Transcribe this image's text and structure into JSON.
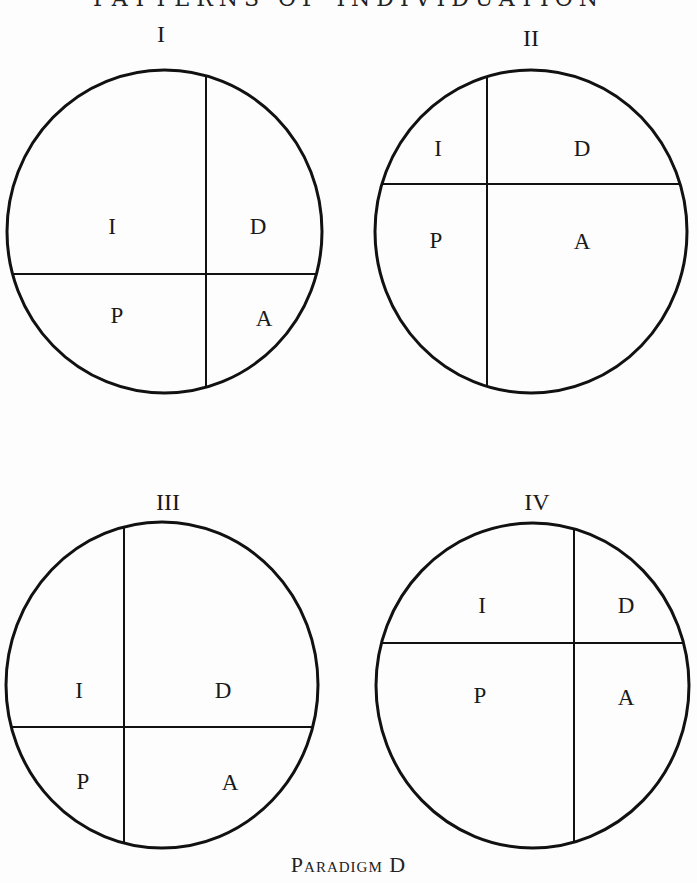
{
  "page": {
    "running_head": "PATTERNS OF INDIVIDUATION",
    "caption": "Paradigm D"
  },
  "style": {
    "ink": "#111111",
    "paper": "#fdfdfd",
    "circle_stroke_width": 3,
    "divider_stroke_width": 2
  },
  "diagrams": [
    {
      "id": "I",
      "title": "I",
      "title_pos": [
        161,
        42
      ],
      "circle": {
        "cx": 164.5,
        "cy": 231.5,
        "rx": 157.5,
        "ry": 161.5
      },
      "vertical_x": 206,
      "horizontal_y": 274,
      "cells": [
        {
          "label": "I",
          "x": 112,
          "y": 234
        },
        {
          "label": "D",
          "x": 258,
          "y": 234
        },
        {
          "label": "P",
          "x": 117,
          "y": 323
        },
        {
          "label": "A",
          "x": 264,
          "y": 326
        }
      ]
    },
    {
      "id": "II",
      "title": "II",
      "title_pos": [
        531,
        46
      ],
      "circle": {
        "cx": 531,
        "cy": 231.5,
        "rx": 156,
        "ry": 161.5
      },
      "vertical_x": 487,
      "horizontal_y": 184,
      "cells": [
        {
          "label": "I",
          "x": 438,
          "y": 156
        },
        {
          "label": "D",
          "x": 582,
          "y": 156
        },
        {
          "label": "P",
          "x": 436,
          "y": 248
        },
        {
          "label": "A",
          "x": 582,
          "y": 249
        }
      ]
    },
    {
      "id": "III",
      "title": "III",
      "title_pos": [
        168,
        510
      ],
      "circle": {
        "cx": 162,
        "cy": 685,
        "rx": 156,
        "ry": 163
      },
      "vertical_x": 124,
      "horizontal_y": 727,
      "cells": [
        {
          "label": "I",
          "x": 79,
          "y": 698
        },
        {
          "label": "D",
          "x": 223,
          "y": 698
        },
        {
          "label": "P",
          "x": 83,
          "y": 789
        },
        {
          "label": "A",
          "x": 230,
          "y": 790
        }
      ]
    },
    {
      "id": "IV",
      "title": "IV",
      "title_pos": [
        537,
        510
      ],
      "circle": {
        "cx": 532.5,
        "cy": 685.5,
        "rx": 156.5,
        "ry": 162.5
      },
      "vertical_x": 574,
      "horizontal_y": 643,
      "cells": [
        {
          "label": "I",
          "x": 482,
          "y": 613
        },
        {
          "label": "D",
          "x": 626,
          "y": 613
        },
        {
          "label": "P",
          "x": 480,
          "y": 703
        },
        {
          "label": "A",
          "x": 626,
          "y": 705
        }
      ]
    }
  ]
}
